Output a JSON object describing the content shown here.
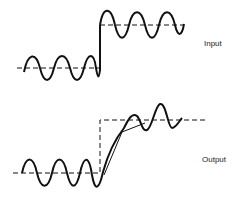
{
  "diagram": {
    "labels": {
      "input": "Input",
      "output": "Output"
    },
    "colors": {
      "stroke": "#111111",
      "background": "#ffffff",
      "text": "#222222"
    },
    "panels": [
      {
        "name": "input",
        "description": "Sinusoid superimposed on a step; dashed reference line steps up abruptly",
        "low_level_y": 68,
        "high_level_y": 25,
        "step_x": 100
      },
      {
        "name": "output",
        "description": "Sinusoid superimposed on a ramped step response; dashed ideal step shown for reference",
        "low_level_y": 173,
        "high_level_y": 120,
        "step_x": 100
      }
    ]
  }
}
